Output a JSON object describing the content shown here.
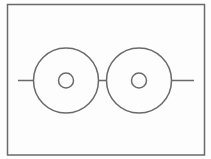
{
  "diagram": {
    "type": "line-drawing",
    "stroke_color": "#6a6a6a",
    "background_color": "#fdfdfd",
    "frame": {
      "x": 7.5,
      "y": 4.5,
      "width": 197,
      "height": 150.5
    },
    "axis_line": {
      "y": 80.5,
      "x_start": 18,
      "x_end": 194
    },
    "discs": [
      {
        "name": "left-disc",
        "cx": 66,
        "cy": 80.5,
        "outer_r": 32.5,
        "inner_r": 7.5
      },
      {
        "name": "right-disc",
        "cx": 139,
        "cy": 80.5,
        "outer_r": 32.5,
        "inner_r": 7.5
      }
    ],
    "segments": [
      {
        "name": "left-stub",
        "x1": 18,
        "x2": 33.5
      },
      {
        "name": "middle-connector",
        "x1": 98.5,
        "x2": 106.5
      },
      {
        "name": "right-stub",
        "x1": 171.5,
        "x2": 194
      }
    ]
  }
}
